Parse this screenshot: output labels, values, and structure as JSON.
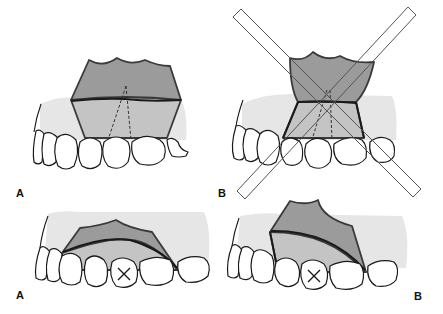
{
  "figure": {
    "panels": [
      {
        "id": "top-left",
        "label": "A",
        "graft": "trapezoid flap with wide base",
        "rejected": false
      },
      {
        "id": "top-right",
        "label": "B",
        "graft": "hourglass flap with narrow base",
        "rejected": true
      },
      {
        "id": "bottom-left",
        "label": "A",
        "graft": "broad flap over extraction site",
        "extraction_marked": true
      },
      {
        "id": "bottom-right",
        "label": "B",
        "graft": "rotated flap over extraction site",
        "extraction_marked": true
      }
    ],
    "labels": {
      "top_left": "A",
      "top_right": "B",
      "bottom_left": "A",
      "bottom_right": "B"
    },
    "colors": {
      "gum": "#e6e6e6",
      "graft_dark": "#9b9b9b",
      "graft_light": "#c4c4c4",
      "outline": "#1a1a1a"
    }
  }
}
